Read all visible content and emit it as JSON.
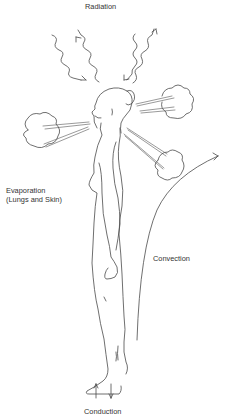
{
  "diagram": {
    "labels": {
      "radiation": "Radiation",
      "evaporation_line1": "Evaporation",
      "evaporation_line2": "(Lungs and Skin)",
      "convection": "Convection",
      "conduction": "Conduction"
    },
    "elements": {
      "figure": "standing-human-figure-profile",
      "radiation_arrows": 4,
      "vapor_clouds": 3,
      "convection_arrow": "curved-upward-arrow",
      "conduction_arrows": [
        "up-arrow",
        "down-arrow"
      ]
    },
    "colors": {
      "line": "#4a4a4a",
      "text": "#333333",
      "background": "#ffffff"
    }
  }
}
